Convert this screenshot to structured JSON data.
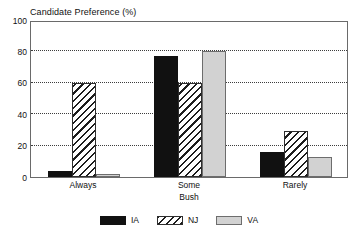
{
  "chart_data": {
    "type": "bar",
    "title": "Candidate Preference (%)",
    "xlabel": "Bush",
    "ylabel": "",
    "categories": [
      "Always",
      "Some",
      "Rarely"
    ],
    "series": [
      {
        "name": "IA",
        "values": [
          4,
          77,
          16
        ],
        "color": "#111111",
        "fill": "solid-black"
      },
      {
        "name": "NJ",
        "values": [
          60,
          60,
          29
        ],
        "color": "#1d1d1d",
        "fill": "diagonal-hatch"
      },
      {
        "name": "VA",
        "values": [
          2,
          80,
          13
        ],
        "color": "#d2d2d2",
        "fill": "light-gray"
      }
    ],
    "ylim": [
      0,
      100
    ],
    "yticks": [
      0,
      20,
      40,
      60,
      80,
      100
    ],
    "ytick_labels": [
      "0",
      "20",
      "40",
      "60",
      "80",
      "100"
    ],
    "grid": true,
    "grid_style": "dotted-horizontal",
    "legend_position": "bottom-center"
  }
}
